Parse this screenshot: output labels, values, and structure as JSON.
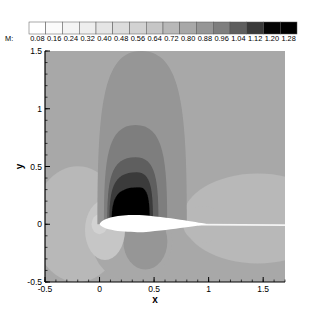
{
  "chart_data": {
    "type": "heatmap",
    "subtype": "filled-contour",
    "title": "",
    "xlabel": "x",
    "ylabel": "y",
    "xlim": [
      -0.5,
      1.7
    ],
    "ylim": [
      -0.5,
      1.5
    ],
    "xticks": [
      -0.5,
      0,
      0.5,
      1,
      1.5
    ],
    "xtick_labels": [
      "-0.5",
      "0",
      "0.5",
      "1",
      "1.5"
    ],
    "yticks": [
      -0.5,
      0,
      0.5,
      1,
      1.5
    ],
    "ytick_labels": [
      "-0.5",
      "0",
      "0.5",
      "1",
      "1.5"
    ],
    "grid": false,
    "legend": {
      "position": "top",
      "variable_label": "M:",
      "levels": [
        0.08,
        0.16,
        0.24,
        0.32,
        0.4,
        0.48,
        0.56,
        0.64,
        0.72,
        0.8,
        0.88,
        0.96,
        1.04,
        1.12,
        1.2,
        1.28
      ],
      "level_labels": [
        "0.08",
        "0.16",
        "0.24",
        "0.32",
        "0.40",
        "0.48",
        "0.56",
        "0.64",
        "0.72",
        "0.80",
        "0.88",
        "0.96",
        "1.04",
        "1.12",
        "1.20",
        "1.28"
      ],
      "colors": [
        "#ffffff",
        "#fbfbfb",
        "#f4f4f4",
        "#eeeeee",
        "#e5e5e5",
        "#dcdcdc",
        "#d2d2d2",
        "#c6c6c6",
        "#b8b8b8",
        "#a8a8a8",
        "#969696",
        "#7e7e7e",
        "#5e5e5e",
        "#3a3a3a",
        "#050505",
        "#000000"
      ]
    },
    "field": {
      "variable": "Mach number",
      "freestream_level": 0.8,
      "description": "Transonic flow over an airfoil (chord 0 to 1 at y=0). Supersonic pocket above the upper surface with peak M > 1.12 near x 0.1–0.45, y 0–0.3; nested lobes extend to y ≈ 1.5 for M ≈ 0.88. Stagnation region (low M) near leading edge, lower-speed lobes below airfoil and behind trailing edge, wake along y = 0.",
      "regions": [
        {
          "level_min": 0.88,
          "shape": "ellipse-lobe",
          "x_range": [
            -0.05,
            0.75
          ],
          "y_range": [
            0.0,
            1.5
          ]
        },
        {
          "level_min": 0.96,
          "shape": "lobe",
          "x_range": [
            0.05,
            0.6
          ],
          "y_range": [
            0.0,
            0.86
          ]
        },
        {
          "level_min": 1.04,
          "shape": "lobe",
          "x_range": [
            0.08,
            0.52
          ],
          "y_range": [
            0.0,
            0.58
          ]
        },
        {
          "level_min": 1.12,
          "shape": "lobe",
          "x_range": [
            0.1,
            0.48
          ],
          "y_range": [
            0.0,
            0.45
          ]
        },
        {
          "level_min": 1.2,
          "shape": "lobe",
          "x_range": [
            0.12,
            0.45
          ],
          "y_range": [
            0.0,
            0.32
          ]
        },
        {
          "level_min": 0.72,
          "level_max": 0.8,
          "shape": "side-lobe",
          "x_range": [
            -0.5,
            0.1
          ],
          "y_range": [
            -0.3,
            0.35
          ]
        },
        {
          "level_min": 0.72,
          "level_max": 0.8,
          "shape": "trailing-lobe",
          "x_range": [
            0.8,
            1.7
          ],
          "y_range": [
            -0.05,
            0.35
          ]
        },
        {
          "level_max": 0.56,
          "shape": "stagnation",
          "x_range": [
            -0.1,
            0.05
          ],
          "y_range": [
            -0.15,
            0.08
          ]
        },
        {
          "level_min": 0.8,
          "level_max": 0.88,
          "shape": "lower-lobe",
          "x_range": [
            0.2,
            0.6
          ],
          "y_range": [
            -0.45,
            0.0
          ]
        }
      ]
    }
  }
}
